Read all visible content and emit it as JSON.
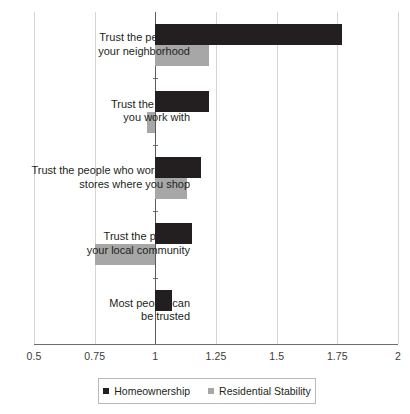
{
  "chart_data": {
    "type": "bar",
    "orientation": "horizontal",
    "title": "",
    "subtitle": "",
    "xlabel": "",
    "ylabel": "",
    "xlim": [
      0.5,
      2
    ],
    "ylim": null,
    "grid": true,
    "baseline": 1,
    "legend_position": "bottom",
    "xticks": [
      0.5,
      0.75,
      1,
      1.25,
      1.5,
      1.75,
      2
    ],
    "xticklabels": [
      "0.5",
      "0.75",
      "1",
      "1.25",
      "1.5",
      "1.75",
      "2"
    ],
    "categories": [
      "Trust the people in\nyour neighborhood",
      "Trust the people\nyou work with",
      "Trust the people who work in the\nstores where you shop",
      "Trust the police in\nyour local community",
      "Most people can\nbe trusted"
    ],
    "series": [
      {
        "name": "Homeownership",
        "color": "#231f20",
        "values": [
          1.77,
          1.22,
          1.19,
          1.15,
          1.07
        ]
      },
      {
        "name": "Residential Stability",
        "color": "#a7a7a7",
        "values": [
          1.22,
          0.965,
          1.13,
          0.75,
          1.0
        ]
      }
    ]
  },
  "legend": {
    "items": [
      {
        "label": "Homeownership",
        "swatch": "dark"
      },
      {
        "label": "Residential Stability",
        "swatch": "light"
      }
    ]
  }
}
